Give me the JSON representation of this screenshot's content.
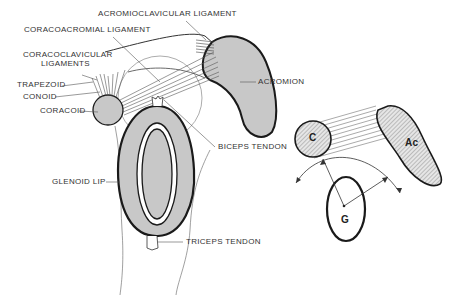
{
  "figure": {
    "left_diagram": {
      "labels": {
        "acromioclavicular": "ACROMIOCLAVICULAR LIGAMENT",
        "coracoacromial": "CORACOACROMIAL LIGAMENT",
        "coracoclavicular_1": "CORACOCLAVICULAR",
        "coracoclavicular_2": "LIGAMENTS",
        "trapezoid": "TRAPEZOID",
        "conoid": "CONOID",
        "coracoid": "CORACOID",
        "acromion": "ACROMION",
        "biceps": "BICEPS TENDON",
        "glenoid": "GLENOID LIP",
        "triceps": "TRICEPS TENDON"
      }
    },
    "right_diagram": {
      "labels": {
        "c": "C",
        "ac": "Ac",
        "g": "G"
      }
    },
    "colors": {
      "bone_fill": "#c8c8c8",
      "outline": "#1a1a1a",
      "leader": "#555555"
    }
  }
}
